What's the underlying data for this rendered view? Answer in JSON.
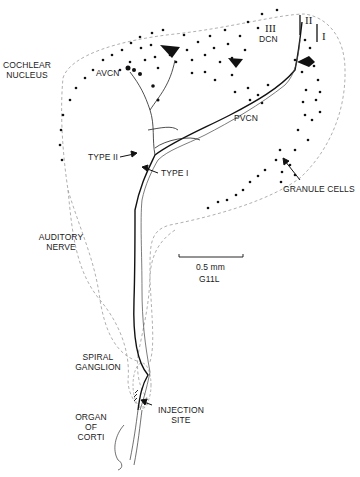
{
  "figure": {
    "labels": {
      "cochlear_nucleus": [
        "COCHLEAR",
        "NUCLEUS"
      ],
      "avcn": "AVCN",
      "dcn": "DCN",
      "pvcn": "PVCN",
      "type_ii": "TYPE II",
      "type_i": "TYPE I",
      "granule_cells": "GRANULE CELLS",
      "auditory_nerve": [
        "AUDITORY",
        "NERVE"
      ],
      "spiral_ganglion": [
        "SPIRAL",
        "GANGLION"
      ],
      "organ_of_corti": [
        "ORGAN",
        "OF",
        "CORTI"
      ],
      "injection_site": [
        "INJECTION",
        "SITE"
      ]
    },
    "layers": {
      "layer_iii": "III",
      "layer_ii": "II",
      "layer_i": "I"
    },
    "scale_bar": {
      "length": "0.5 mm",
      "specimen_id": "G11L"
    },
    "colors": {
      "ink": "#111111",
      "outline_dashed": "#9a9a9a"
    }
  }
}
